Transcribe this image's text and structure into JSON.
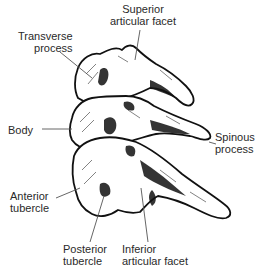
{
  "diagram": {
    "colors": {
      "ink": "#111111",
      "label": "#2a2a2a",
      "background": "#ffffff",
      "leader": "#555555"
    },
    "labels": [
      {
        "id": "superior-articular-facet",
        "line1": "Superior",
        "line2": "articular facet"
      },
      {
        "id": "transverse-process",
        "line1": "Transverse",
        "line2": "process"
      },
      {
        "id": "body",
        "line1": "Body",
        "line2": ""
      },
      {
        "id": "spinous-process",
        "line1": "Spinous",
        "line2": "process"
      },
      {
        "id": "anterior-tubercle",
        "line1": "Anterior",
        "line2": "tubercle"
      },
      {
        "id": "posterior-tubercle",
        "line1": "Posterior",
        "line2": "tubercle"
      },
      {
        "id": "inferior-articular-facet",
        "line1": "Inferior",
        "line2": "articular facet"
      }
    ]
  }
}
